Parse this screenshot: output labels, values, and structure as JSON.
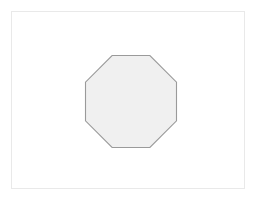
{
  "app": {
    "title": "Shape Canvas",
    "background_color": "#ffffff"
  },
  "canvas": {
    "name": "drawing-canvas",
    "width": 234,
    "height": 178,
    "left": 11,
    "top": 11,
    "background_color": "#ffffff",
    "border_color": "#e9e9e9",
    "border_width": 1
  },
  "shapes": [
    {
      "id": "octagon-1",
      "type": "octagon",
      "sides": 8,
      "label": "",
      "fill_color": "#f0f0f0",
      "stroke_color": "#9a9a9a",
      "stroke_width": 1.1,
      "center_x": 131,
      "center_y": 101.5,
      "width": 91,
      "height": 92,
      "bounds": {
        "left": 85.5,
        "top": 55.5,
        "right": 176.5,
        "bottom": 147.5
      },
      "points": "112.1,55.5 149.9,55.5 176.5,82.2 176.5,120.8 149.9,147.5 112.1,147.5 85.5,120.8 85.5,82.2"
    }
  ]
}
